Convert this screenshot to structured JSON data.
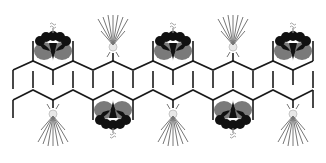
{
  "diagram": {
    "colors": {
      "chain": "#1a1a1a",
      "flower_dark": "#111111",
      "flower_grey": "#7a7a7a",
      "burst_ray": "#777777",
      "burst_node": "#e8e8e8"
    },
    "upper_chain": {
      "flowers_above_x": [
        52,
        172,
        292
      ],
      "bursts_above_x": [
        112,
        232
      ]
    },
    "lower_chain": {
      "flowers_below_x": [
        112,
        232
      ],
      "bursts_below_x": [
        52,
        172,
        292
      ]
    }
  }
}
